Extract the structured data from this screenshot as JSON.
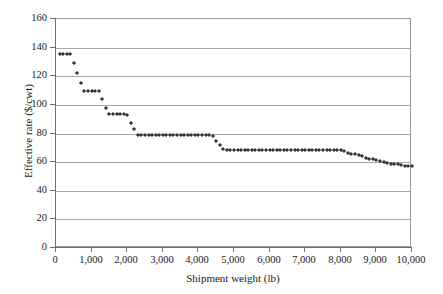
{
  "chart_data": {
    "type": "scatter",
    "title": "",
    "xlabel": "Shipment weight (lb)",
    "ylabel": "Effective rate ($/cwt)",
    "xlim": [
      0,
      10000
    ],
    "ylim": [
      0,
      160
    ],
    "xticks": [
      0,
      1000,
      2000,
      3000,
      4000,
      5000,
      6000,
      7000,
      8000,
      9000,
      10000
    ],
    "xticklabels": [
      "0",
      "1,000",
      "2,000",
      "3,000",
      "4,000",
      "5,000",
      "6,000",
      "7,000",
      "8,000",
      "9,000",
      "10,000"
    ],
    "yticks": [
      0,
      20,
      40,
      60,
      80,
      100,
      120,
      140,
      160
    ],
    "yticklabels": [
      "0",
      "20",
      "40",
      "60",
      "80",
      "100",
      "120",
      "140",
      "160"
    ],
    "grid": "horizontal",
    "legend": "none",
    "marker": "diamond",
    "marker_color": "#333333",
    "series": [
      {
        "name": "Effective rate",
        "x": [
          100,
          200,
          300,
          400,
          500,
          600,
          700,
          800,
          900,
          1000,
          1100,
          1200,
          1300,
          1400,
          1500,
          1600,
          1700,
          1800,
          1900,
          2000,
          2100,
          2200,
          2300,
          2400,
          2500,
          2600,
          2700,
          2800,
          2900,
          3000,
          3100,
          3200,
          3300,
          3400,
          3500,
          3600,
          3700,
          3800,
          3900,
          4000,
          4100,
          4200,
          4300,
          4400,
          4500,
          4600,
          4700,
          4800,
          4900,
          5000,
          5100,
          5200,
          5300,
          5400,
          5500,
          5600,
          5700,
          5800,
          5900,
          6000,
          6100,
          6200,
          6300,
          6400,
          6500,
          6600,
          6700,
          6800,
          6900,
          7000,
          7100,
          7200,
          7300,
          7400,
          7500,
          7600,
          7700,
          7800,
          7900,
          8000,
          8100,
          8200,
          8300,
          8400,
          8500,
          8600,
          8700,
          8800,
          8900,
          9000,
          9100,
          9200,
          9300,
          9400,
          9500,
          9600,
          9700,
          9800,
          9900,
          10000
        ],
        "y": [
          135.5,
          135.5,
          135.5,
          135.5,
          129.0,
          122.0,
          115.0,
          110.0,
          110.0,
          110.0,
          110.0,
          110.0,
          104.0,
          98.0,
          93.5,
          93.5,
          93.5,
          93.5,
          93.5,
          93.0,
          87.5,
          83.0,
          79.0,
          79.0,
          79.0,
          79.0,
          79.0,
          79.0,
          79.0,
          79.0,
          79.0,
          79.0,
          79.0,
          79.0,
          79.0,
          79.0,
          79.0,
          79.0,
          79.0,
          79.0,
          79.0,
          79.0,
          79.0,
          78.0,
          75.0,
          72.0,
          69.5,
          68.5,
          68.5,
          68.5,
          68.5,
          68.5,
          68.5,
          68.5,
          68.5,
          68.5,
          68.5,
          68.5,
          68.5,
          68.5,
          68.5,
          68.5,
          68.5,
          68.5,
          68.5,
          68.5,
          68.5,
          68.5,
          68.5,
          68.5,
          68.5,
          68.5,
          68.5,
          68.5,
          68.5,
          68.5,
          68.5,
          68.5,
          68.5,
          68.5,
          67.5,
          66.5,
          66.0,
          65.5,
          65.0,
          64.0,
          63.0,
          62.5,
          62.0,
          61.5,
          61.0,
          60.0,
          59.5,
          59.0,
          58.5,
          58.5,
          58.0,
          57.5,
          57.0,
          57.0
        ]
      }
    ]
  }
}
